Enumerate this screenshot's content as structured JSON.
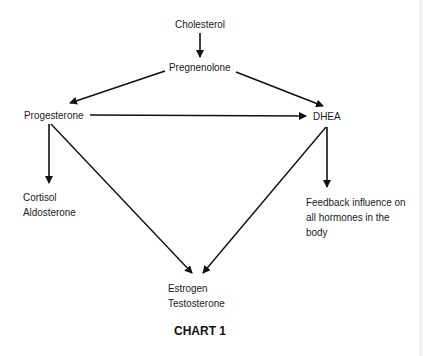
{
  "diagram": {
    "nodes": {
      "cholesterol": "Cholesterol",
      "pregnenolone": "Pregnenolone",
      "progesterone": "Progesterone",
      "dhea": "DHEA",
      "cortisol": "Cortisol",
      "aldosterone": "Aldosterone",
      "estrogen": "Estrogen",
      "testosterone": "Testosterone",
      "feedback_line1": "Feedback influence on",
      "feedback_line2": "all hormones in the",
      "feedback_line3": "body"
    },
    "edges": [
      {
        "from": "Cholesterol",
        "to": "Pregnenolone"
      },
      {
        "from": "Pregnenolone",
        "to": "Progesterone"
      },
      {
        "from": "Pregnenolone",
        "to": "DHEA"
      },
      {
        "from": "Progesterone",
        "to": "DHEA"
      },
      {
        "from": "Progesterone",
        "to": "Cortisol / Aldosterone"
      },
      {
        "from": "Progesterone",
        "to": "Estrogen / Testosterone"
      },
      {
        "from": "DHEA",
        "to": "Estrogen / Testosterone"
      },
      {
        "from": "DHEA",
        "to": "Feedback influence on all hormones in the body"
      }
    ],
    "caption": "CHART 1"
  }
}
